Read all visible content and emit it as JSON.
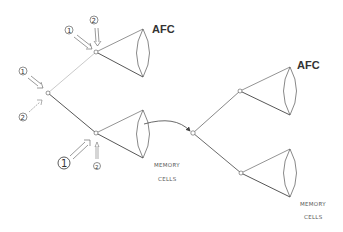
{
  "diagram": {
    "left": {
      "afc_label": "AFC",
      "memory_label_line1": "MEMORY",
      "memory_label_line2": "CELLS",
      "stimuli": [
        {
          "label": "1",
          "target": "upper-node"
        },
        {
          "label": "2",
          "target": "upper-node"
        },
        {
          "label": "1",
          "target": "root-node"
        },
        {
          "label": "2",
          "target": "root-node"
        },
        {
          "label": "1",
          "target": "lower-node",
          "emphasis": "large"
        },
        {
          "label": "2",
          "target": "lower-node",
          "emphasis": "small"
        }
      ]
    },
    "right": {
      "afc_label": "AFC",
      "memory_label_line1": "MEMORY",
      "memory_label_line2": "CELLS"
    },
    "colors": {
      "line": "#444444",
      "faint_line": "#aaaaaa",
      "background": "#ffffff"
    }
  }
}
